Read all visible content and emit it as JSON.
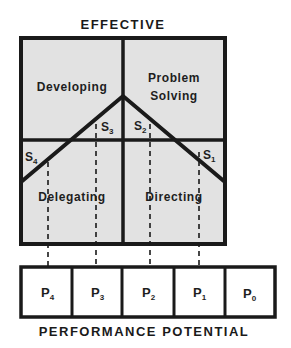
{
  "title_top": "EFFECTIVE",
  "title_bottom": "PERFORMANCE POTENTIAL",
  "quadrants": {
    "top_left": "Developing",
    "top_right_line1": "Problem",
    "top_right_line2": "Solving",
    "bottom_left": "Delegating",
    "bottom_right": "Directing"
  },
  "styles": [
    {
      "id": "S4",
      "letter": "S",
      "sub": "4"
    },
    {
      "id": "S3",
      "letter": "S",
      "sub": "3"
    },
    {
      "id": "S2",
      "letter": "S",
      "sub": "2"
    },
    {
      "id": "S1",
      "letter": "S",
      "sub": "1"
    }
  ],
  "performance_levels": [
    {
      "id": "P4",
      "letter": "P",
      "sub": "4"
    },
    {
      "id": "P3",
      "letter": "P",
      "sub": "3"
    },
    {
      "id": "P2",
      "letter": "P",
      "sub": "2"
    },
    {
      "id": "P1",
      "letter": "P",
      "sub": "1"
    },
    {
      "id": "P0",
      "letter": "P",
      "sub": "0"
    }
  ],
  "colors": {
    "quadrant_fill": "#e2e2e2",
    "line": "#1a1a1a",
    "cell_fill": "#ffffff"
  }
}
